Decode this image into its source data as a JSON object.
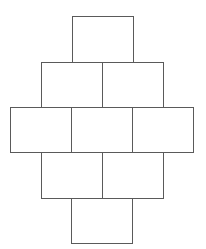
{
  "diagram": {
    "type": "cell-grid",
    "line_color": "#5a5a5a",
    "background": "#ffffff",
    "rows": [
      {
        "row": 0,
        "cells": [
          {
            "x": 72,
            "y": 16,
            "w": 62,
            "h": 47
          }
        ]
      },
      {
        "row": 1,
        "cells": [
          {
            "x": 41,
            "y": 62,
            "w": 62,
            "h": 46
          },
          {
            "x": 102,
            "y": 62,
            "w": 62,
            "h": 46
          }
        ]
      },
      {
        "row": 2,
        "cells": [
          {
            "x": 10,
            "y": 107,
            "w": 62,
            "h": 46
          },
          {
            "x": 71,
            "y": 107,
            "w": 62,
            "h": 46
          },
          {
            "x": 132,
            "y": 107,
            "w": 62,
            "h": 46
          }
        ]
      },
      {
        "row": 3,
        "cells": [
          {
            "x": 41,
            "y": 152,
            "w": 62,
            "h": 47
          },
          {
            "x": 102,
            "y": 152,
            "w": 62,
            "h": 47
          }
        ]
      },
      {
        "row": 4,
        "cells": [
          {
            "x": 71,
            "y": 198,
            "w": 62,
            "h": 46
          }
        ]
      }
    ],
    "cell_labels": [
      "",
      "",
      "",
      "",
      "",
      "",
      "",
      "",
      ""
    ]
  }
}
